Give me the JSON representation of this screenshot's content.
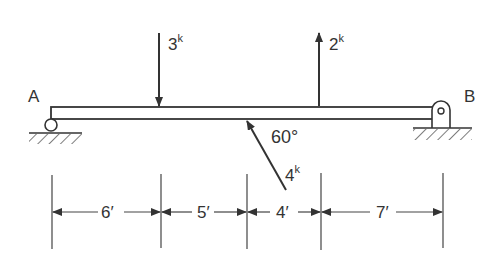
{
  "diagram": {
    "type": "simply-supported beam",
    "supports": {
      "left": {
        "label": "A",
        "kind": "roller"
      },
      "right": {
        "label": "B",
        "kind": "pin"
      }
    },
    "loads": [
      {
        "magnitude": "3",
        "unit": "k",
        "direction": "down",
        "position_ft": 6
      },
      {
        "magnitude": "2",
        "unit": "k",
        "direction": "up",
        "position_ft": 15
      },
      {
        "magnitude": "4",
        "unit": "k",
        "direction": "inclined",
        "angle": "60°",
        "position_ft": 11
      }
    ],
    "angle_label": "60°",
    "dimensions": [
      "6′",
      "5′",
      "4′",
      "7′"
    ]
  }
}
